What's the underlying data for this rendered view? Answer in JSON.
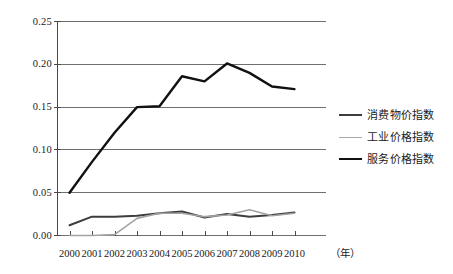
{
  "chart_data": {
    "type": "line",
    "title": "",
    "xlabel": "年",
    "ylabel": "",
    "grid": true,
    "legend_position": "right",
    "xlim": [
      2000,
      2010
    ],
    "ylim": [
      0.0,
      0.25
    ],
    "ytick_labels": [
      "0.25",
      "0.20",
      "0.15",
      "0.10",
      "0.05",
      "0.00"
    ],
    "ytick_values": [
      0.25,
      0.2,
      0.15,
      0.1,
      0.05,
      0.0
    ],
    "categories": [
      "2000",
      "2001",
      "2002",
      "2003",
      "2004",
      "2005",
      "2006",
      "2007",
      "2008",
      "2009",
      "2010"
    ],
    "x": [
      2000,
      2001,
      2002,
      2003,
      2004,
      2005,
      2006,
      2007,
      2008,
      2009,
      2010
    ],
    "series": [
      {
        "name": "消费物价指数",
        "color": "#3d3d3d",
        "width": 2.0,
        "values": [
          0.012,
          0.022,
          0.022,
          0.023,
          0.026,
          0.028,
          0.021,
          0.025,
          0.022,
          0.024,
          0.027
        ]
      },
      {
        "name": "工业价格指数",
        "color": "#a3a3a3",
        "width": 1.6,
        "values": [
          0.0,
          0.0,
          0.001,
          0.02,
          0.026,
          0.026,
          0.022,
          0.024,
          0.03,
          0.023,
          0.026
        ]
      },
      {
        "name": "服务价格指数",
        "color": "#111111",
        "width": 2.4,
        "values": [
          0.05,
          0.086,
          0.12,
          0.15,
          0.151,
          0.186,
          0.18,
          0.201,
          0.19,
          0.174,
          0.171
        ]
      }
    ]
  },
  "axes": {
    "unit_label": "（年）"
  },
  "legend": {
    "items": [
      {
        "label": "消费物价指数",
        "color": "#3d3d3d",
        "width": "2.2px"
      },
      {
        "label": "工业价格指数",
        "color": "#a9a9a9",
        "width": "1.8px"
      },
      {
        "label": "服务价格指数",
        "color": "#111111",
        "width": "2.6px"
      }
    ]
  },
  "colors": {
    "gridline": "#6f6f6f",
    "axis": "#4a4a4a",
    "background": "#ffffff"
  }
}
